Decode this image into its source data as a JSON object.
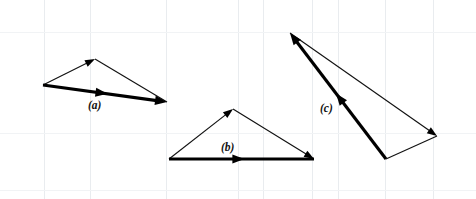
{
  "figure": {
    "width": 476,
    "height": 199,
    "background_color": "#ffffff",
    "grid_color": "#e9ecef",
    "stroke_color": "#000000"
  },
  "grid": {
    "vertical_x": [
      44,
      90,
      166,
      238,
      263,
      312,
      338,
      385,
      433
    ],
    "horizontal_y": [
      32,
      133,
      190
    ]
  },
  "diagrams": [
    {
      "id": "a",
      "label": "(a)",
      "label_x": 88,
      "label_y": 109,
      "vertices": {
        "tail": [
          43,
          85
        ],
        "apex": [
          95,
          59
        ],
        "head": [
          167,
          102
        ]
      },
      "vectors": [
        {
          "name": "vector-a-1",
          "style": "thin",
          "from": [
            43,
            85
          ],
          "to": [
            95,
            59
          ],
          "arrow_at": "end"
        },
        {
          "name": "vector-a-2",
          "style": "thin",
          "from": [
            95,
            59
          ],
          "to": [
            167,
            102
          ],
          "arrow_at": "none"
        },
        {
          "name": "vector-a-resultant",
          "style": "thick",
          "from": [
            43,
            85
          ],
          "to": [
            167,
            102
          ],
          "arrow_at": "both-mid-and-end"
        }
      ]
    },
    {
      "id": "b",
      "label": "(b)",
      "label_x": 221,
      "label_y": 151,
      "vertices": {
        "tail": [
          169,
          159
        ],
        "apex": [
          233,
          109
        ],
        "head": [
          314,
          159
        ]
      },
      "vectors": [
        {
          "name": "vector-b-1",
          "style": "thin",
          "from": [
            169,
            159
          ],
          "to": [
            233,
            109
          ],
          "arrow_at": "end"
        },
        {
          "name": "vector-b-2",
          "style": "thin",
          "from": [
            233,
            109
          ],
          "to": [
            314,
            159
          ],
          "arrow_at": "end"
        },
        {
          "name": "vector-b-resultant",
          "style": "thick",
          "from": [
            169,
            159
          ],
          "to": [
            314,
            159
          ],
          "arrow_at": "mid"
        }
      ]
    },
    {
      "id": "c",
      "label": "(c)",
      "label_x": 320,
      "label_y": 112,
      "vertices": {
        "tail": [
          386,
          159
        ],
        "apex": [
          290,
          33
        ],
        "head": [
          437,
          136
        ]
      },
      "vectors": [
        {
          "name": "vector-c-1",
          "style": "thin",
          "from": [
            290,
            33
          ],
          "to": [
            437,
            136
          ],
          "arrow_at": "end"
        },
        {
          "name": "vector-c-2",
          "style": "thin",
          "from": [
            437,
            136
          ],
          "to": [
            386,
            159
          ],
          "arrow_at": "none"
        },
        {
          "name": "vector-c-resultant",
          "style": "thick",
          "from": [
            386,
            159
          ],
          "to": [
            290,
            33
          ],
          "arrow_at": "mid-and-end"
        }
      ]
    }
  ],
  "chart_data": {
    "type": "diagram",
    "subtype": "vector-triangle",
    "xlabel": "",
    "ylabel": "",
    "xlim": [
      0,
      476
    ],
    "ylim": [
      199,
      0
    ],
    "grid": true,
    "legend": "none",
    "annotations": [
      "(a)",
      "(b)",
      "(c)"
    ],
    "series": [
      {
        "name": "(a)",
        "points": [
          [
            43,
            85
          ],
          [
            95,
            59
          ],
          [
            167,
            102
          ],
          [
            43,
            85
          ]
        ],
        "resultant": [
          [
            43,
            85
          ],
          [
            167,
            102
          ]
        ]
      },
      {
        "name": "(b)",
        "points": [
          [
            169,
            159
          ],
          [
            233,
            109
          ],
          [
            314,
            159
          ],
          [
            169,
            159
          ]
        ],
        "resultant": [
          [
            169,
            159
          ],
          [
            314,
            159
          ]
        ]
      },
      {
        "name": "(c)",
        "points": [
          [
            290,
            33
          ],
          [
            437,
            136
          ],
          [
            386,
            159
          ],
          [
            290,
            33
          ]
        ],
        "resultant": [
          [
            386,
            159
          ],
          [
            290,
            33
          ]
        ]
      }
    ]
  }
}
